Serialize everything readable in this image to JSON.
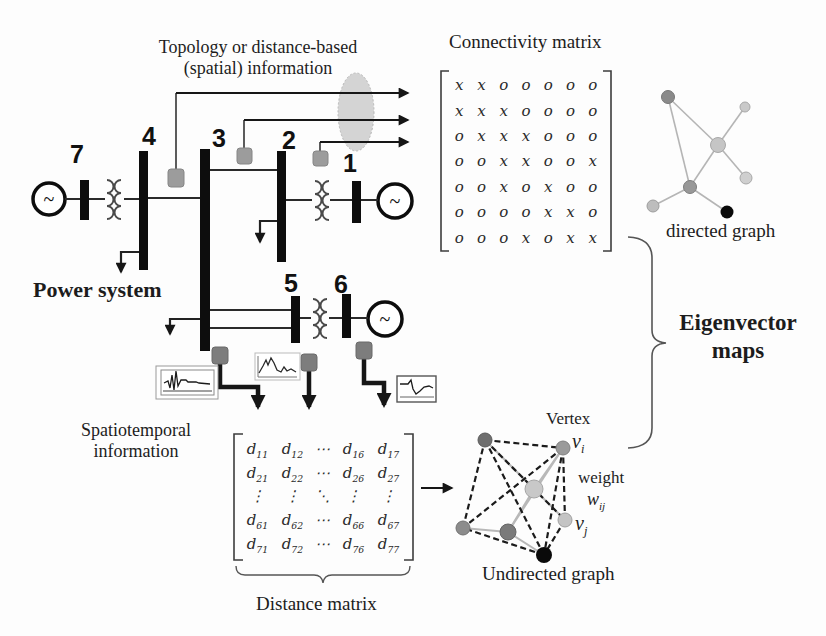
{
  "figure": {
    "topology_label": {
      "line1": "Topology or distance-based",
      "line2": "(spatial) information"
    },
    "connectivity_title": "Connectivity matrix",
    "directed_graph_label": "directed graph",
    "power_system_label": "Power system",
    "eigenvector": {
      "line1": "Eigenvector",
      "line2": "maps"
    },
    "spatiotemporal": {
      "line1": "Spatiotemporal",
      "line2": "information"
    },
    "distance_title": "Distance matrix",
    "undirected_graph_label": "Undirected graph",
    "vertex_label": "Vertex",
    "vertex_i": {
      "base": "v",
      "sub": "i"
    },
    "weight_label": "weight",
    "weight_ij": {
      "base": "w",
      "sub": "ij"
    },
    "vertex_j": {
      "base": "v",
      "sub": "j"
    },
    "generator_symbol": "~",
    "bus_numbers": {
      "b7": "7",
      "b4": "4",
      "b3": "3",
      "b2": "2",
      "b1": "1",
      "b5": "5",
      "b6": "6"
    }
  },
  "matrices": {
    "connectivity_matrix": {
      "rows": [
        [
          "x",
          "x",
          "o",
          "o",
          "o",
          "o",
          "o"
        ],
        [
          "x",
          "x",
          "x",
          "o",
          "o",
          "o",
          "o"
        ],
        [
          "o",
          "x",
          "x",
          "x",
          "o",
          "o",
          "o"
        ],
        [
          "o",
          "o",
          "x",
          "x",
          "o",
          "o",
          "x"
        ],
        [
          "o",
          "o",
          "x",
          "o",
          "x",
          "o",
          "o"
        ],
        [
          "o",
          "o",
          "o",
          "o",
          "x",
          "x",
          "o"
        ],
        [
          "o",
          "o",
          "o",
          "x",
          "o",
          "x",
          "x"
        ]
      ]
    },
    "distance_matrix": {
      "rows": [
        [
          "d11",
          "d12",
          "⋯",
          "d16",
          "d17"
        ],
        [
          "d21",
          "d22",
          "⋯",
          "d26",
          "d27"
        ],
        [
          "⋮",
          "⋮",
          "⋱",
          "⋮",
          "⋮"
        ],
        [
          "d61",
          "d62",
          "⋯",
          "d66",
          "d67"
        ],
        [
          "d71",
          "d72",
          "⋯",
          "d76",
          "d77"
        ]
      ]
    }
  },
  "colors": {
    "line": "#2a2a2a",
    "bus": "#0d0d0d",
    "sensor_gray": "#8f8f8f",
    "ellipse_gray": "#cdcdcd",
    "graph_edge_gray": "#b5b5b5",
    "node_black": "#0a0a0a",
    "node_light": "#c6c6c6",
    "node_medium": "#8a8a8a"
  }
}
